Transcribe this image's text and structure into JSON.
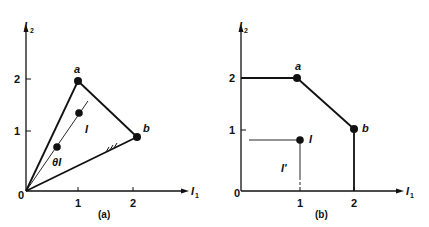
{
  "figure": {
    "panel_a": {
      "caption": "(a)",
      "x_axis_label": "I",
      "x_axis_sub": "1",
      "y_axis_label": "I",
      "y_axis_sub": "2",
      "origin_label": "0",
      "x_ticks": [
        "1",
        "2"
      ],
      "y_ticks": [
        "1",
        "2"
      ],
      "points": [
        {
          "label": "a",
          "x": 1,
          "y": 2
        },
        {
          "label": "b",
          "x": 2.1,
          "y": 0.95
        },
        {
          "label": "I",
          "x": 1,
          "y": 1.35
        },
        {
          "label": "θI",
          "x": 0.6,
          "y": 0.7
        }
      ],
      "point_label_I": "I",
      "point_label_thetaI": "θI",
      "point_label_a": "a",
      "point_label_b": "b"
    },
    "panel_b": {
      "caption": "(b)",
      "x_axis_label": "I",
      "x_axis_sub": "1",
      "y_axis_label": "I",
      "y_axis_sub": "2",
      "origin_label": "0",
      "x_ticks": [
        "1",
        "2"
      ],
      "y_ticks": [
        "1",
        "2"
      ],
      "points": [
        {
          "label": "a",
          "x": 1,
          "y": 2
        },
        {
          "label": "b",
          "x": 2,
          "y": 1
        },
        {
          "label": "I",
          "x": 1,
          "y": 0.8
        }
      ],
      "point_label_I": "I",
      "point_label_Iprime": "I'",
      "point_label_a": "a",
      "point_label_b": "b"
    }
  }
}
